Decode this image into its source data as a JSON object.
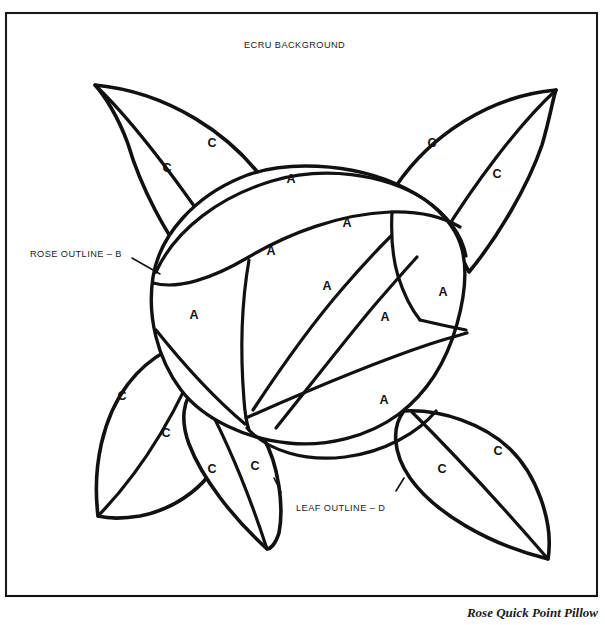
{
  "document": {
    "type": "needlepoint-pattern-diagram",
    "caption": "Rose Quick Point Pillow",
    "background_color": "#ffffff",
    "ink_color": "#111111",
    "frame": {
      "x": 5,
      "y": 12,
      "width": 593,
      "height": 585
    }
  },
  "callouts": [
    {
      "id": "ecru-background",
      "text": "ECRU BACKGROUND",
      "x": 244,
      "y": 40,
      "has_leader": false
    },
    {
      "id": "rose-outline",
      "text": "ROSE OUTLINE – B",
      "x": 30,
      "y": 249,
      "has_leader": true
    },
    {
      "id": "leaf-outline",
      "text": "LEAF OUTLINE – D",
      "x": 296,
      "y": 503,
      "has_leader": true
    }
  ],
  "legend_keys": {
    "rose_petal_symbol": "A",
    "rose_outline_symbol": "B",
    "leaf_symbol": "C",
    "leaf_outline_symbol": "D"
  },
  "zone_labels": [
    {
      "symbol": "C",
      "x": 167,
      "y": 169,
      "region": "leaf-top-left-outer"
    },
    {
      "symbol": "C",
      "x": 212,
      "y": 144,
      "region": "leaf-top-left-inner"
    },
    {
      "symbol": "C",
      "x": 432,
      "y": 144,
      "region": "leaf-top-right-inner"
    },
    {
      "symbol": "C",
      "x": 497,
      "y": 175,
      "region": "leaf-top-right-outer"
    },
    {
      "symbol": "A",
      "x": 291,
      "y": 180,
      "region": "petal-outer-top"
    },
    {
      "symbol": "A",
      "x": 347,
      "y": 224,
      "region": "petal-upper-right"
    },
    {
      "symbol": "A",
      "x": 271,
      "y": 252,
      "region": "petal-upper-left"
    },
    {
      "symbol": "A",
      "x": 327,
      "y": 287,
      "region": "petal-mid-center"
    },
    {
      "symbol": "A",
      "x": 443,
      "y": 293,
      "region": "petal-right-edge"
    },
    {
      "symbol": "A",
      "x": 194,
      "y": 316,
      "region": "petal-left"
    },
    {
      "symbol": "A",
      "x": 385,
      "y": 318,
      "region": "petal-mid-right"
    },
    {
      "symbol": "A",
      "x": 384,
      "y": 401,
      "region": "petal-lower-right"
    },
    {
      "symbol": "C",
      "x": 122,
      "y": 397,
      "region": "leaf-bottom-left-outer"
    },
    {
      "symbol": "C",
      "x": 166,
      "y": 434,
      "region": "leaf-bottom-left-inner"
    },
    {
      "symbol": "C",
      "x": 212,
      "y": 470,
      "region": "leaf-bottom-center-left"
    },
    {
      "symbol": "C",
      "x": 255,
      "y": 467,
      "region": "leaf-bottom-center-right"
    },
    {
      "symbol": "C",
      "x": 442,
      "y": 470,
      "region": "leaf-bottom-right-inner"
    },
    {
      "symbol": "C",
      "x": 498,
      "y": 452,
      "region": "leaf-bottom-right-outer"
    }
  ],
  "leaves": [
    {
      "id": "leaf-top-left",
      "tip": [
        95,
        85
      ],
      "label_count": 2
    },
    {
      "id": "leaf-top-right",
      "tip": [
        556,
        90
      ],
      "label_count": 2
    },
    {
      "id": "leaf-bottom-left",
      "tip": [
        98,
        516
      ],
      "label_count": 2
    },
    {
      "id": "leaf-bottom-center",
      "tip": [
        267,
        549
      ],
      "label_count": 2
    },
    {
      "id": "leaf-bottom-right",
      "tip": [
        548,
        559
      ],
      "label_count": 2
    }
  ],
  "rose": {
    "center": [
      305,
      300
    ],
    "petal_count": 8,
    "outer_radius_x": 148,
    "outer_radius_y": 135
  }
}
